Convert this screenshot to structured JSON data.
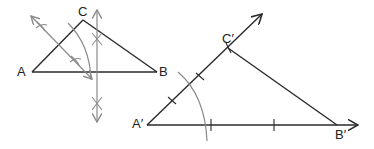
{
  "figure": {
    "colors": {
      "line": "#2a2a2a",
      "construction": "#8a8a8a",
      "background": "#ffffff"
    }
  },
  "original_triangle": {
    "labels": {
      "A": "A",
      "B": "B",
      "C": "C"
    },
    "vertices": {
      "A": [
        32,
        72
      ],
      "B": [
        157,
        72
      ],
      "C": [
        83,
        20
      ]
    }
  },
  "copied_triangle": {
    "labels": {
      "A": "A′",
      "B": "B′",
      "C": "C′"
    },
    "vertices": {
      "A": [
        147,
        125
      ],
      "B": [
        337,
        125
      ],
      "C": [
        228,
        48
      ]
    }
  }
}
